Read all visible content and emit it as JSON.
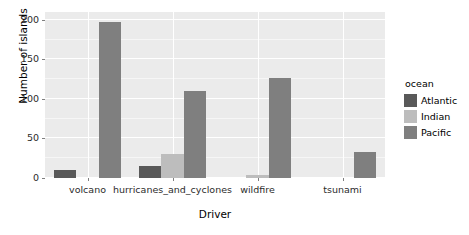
{
  "chart_data": {
    "type": "bar",
    "title": "",
    "xlabel": "Driver",
    "ylabel": "Number of islands",
    "categories": [
      "volcano",
      "hurricanes_and_cyclones",
      "wildfire",
      "tsunami"
    ],
    "legend_title": "ocean",
    "legend_position": "right",
    "grid": true,
    "ylim": [
      0,
      210
    ],
    "yticks": [
      0,
      50,
      100,
      150,
      200
    ],
    "ytick_labels": [
      "0",
      "50",
      "100",
      "150",
      "200"
    ],
    "series": [
      {
        "name": "Atlantic",
        "color": "#595959",
        "values": [
          10,
          15,
          0,
          0
        ]
      },
      {
        "name": "Indian",
        "color": "#bdbdbd",
        "values": [
          0,
          30,
          4,
          0
        ]
      },
      {
        "name": "Pacific",
        "color": "#7f7f7f",
        "values": [
          197,
          110,
          127,
          33
        ]
      }
    ]
  },
  "panel": {
    "background_color": "#ebebeb",
    "gridline_color": "#ffffff"
  }
}
